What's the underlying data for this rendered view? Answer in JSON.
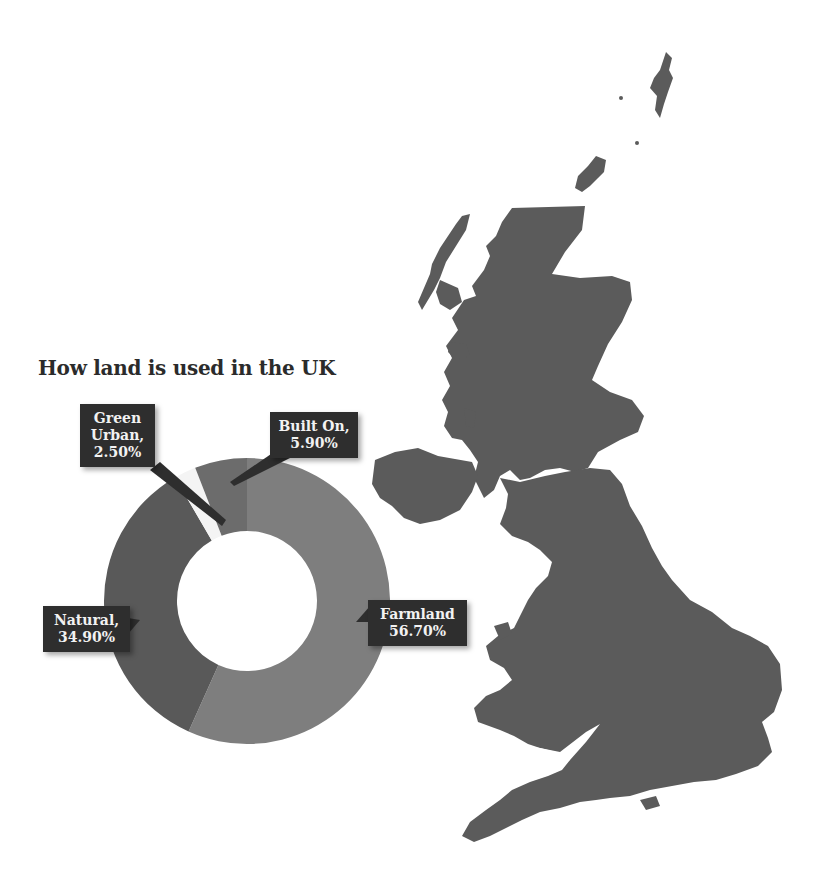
{
  "page": {
    "background": "#ffffff",
    "show_through_text_lines": [
      "",
      "",
      "",
      "",
      "",
      "",
      "",
      "",
      "",
      "",
      "",
      ""
    ]
  },
  "chart": {
    "title": "How land is used in the UK",
    "labels": [
      {
        "name": "Green Urban",
        "line1": "Green",
        "line2": "Urban,",
        "line3": "2.50%"
      },
      {
        "name": "Built On",
        "line1": "Built On,",
        "line2": "5.90%"
      },
      {
        "name": "Natural",
        "line1": "Natural,",
        "line2": "34.90%"
      },
      {
        "name": "Farmland",
        "line1": "Farmland",
        "line2": "56.70%"
      }
    ],
    "colors": {
      "farmland": "#7e7e7e",
      "natural": "#595959",
      "green_urban": "#f4f4f4",
      "built_on": "#6c6c6c",
      "label_bg": "#2e2e2e",
      "label_text": "#f2f2f2",
      "map_fill": "#5b5b5b"
    }
  },
  "chart_data": {
    "type": "pie",
    "subtype": "donut",
    "title": "How land is used in the UK",
    "categories": [
      "Farmland",
      "Natural",
      "Green Urban",
      "Built On"
    ],
    "values": [
      56.7,
      34.9,
      2.5,
      5.9
    ],
    "unit": "%",
    "data_labels": [
      "Farmland 56.70%",
      "Natural, 34.90%",
      "Green Urban, 2.50%",
      "Built On, 5.90%"
    ],
    "legend": "none (callout labels)",
    "background_image": "map of the United Kingdom"
  }
}
